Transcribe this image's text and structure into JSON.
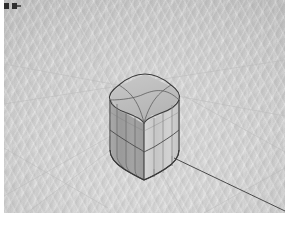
{
  "app": {
    "window_title": "3D Modeling Viewport",
    "background_color": "#cccccc"
  },
  "toolbar": {
    "marks": [
      {
        "name": "select-tool-marker",
        "label": ""
      },
      {
        "name": "pan-tool-marker",
        "label": ""
      }
    ]
  },
  "viewport": {
    "name": "3d-viewport",
    "ground_color": "#cfcfcf",
    "horizon_color": "#c4c4c4",
    "grid_line_color": "#bdbdbd",
    "width": 281,
    "height": 213
  },
  "model": {
    "name": "rounded-box",
    "description": "Rounded-corner box with subdivided faces",
    "edge_color": "#3a3a3a",
    "subdivision_color": "#6b6b6b",
    "top_face_color": "#c0c0c0",
    "left_face_color": "#9f9f9f",
    "right_face_color": "#cfcfcf",
    "top_face_divisions": 2,
    "body_horizontal_divisions": 2,
    "bounds": {
      "x": 104,
      "y": 74,
      "width": 78,
      "height": 100
    }
  },
  "guide_line": {
    "name": "inference-guide-line",
    "color": "#4a4a4a",
    "from": {
      "x": 172,
      "y": 160
    },
    "to": {
      "x": 283,
      "y": 212
    }
  },
  "ground_guides": [
    {
      "name": "ground-guide-1",
      "x1": 0,
      "y1": 196,
      "x2": 128,
      "y2": 124
    },
    {
      "name": "ground-guide-2",
      "x1": 0,
      "y1": 148,
      "x2": 104,
      "y2": 208
    },
    {
      "name": "ground-guide-3",
      "x1": 24,
      "y1": 212,
      "x2": 176,
      "y2": 98
    },
    {
      "name": "ground-guide-4",
      "x1": 180,
      "y1": 96,
      "x2": 281,
      "y2": 152
    },
    {
      "name": "ground-guide-5",
      "x1": 0,
      "y1": 104,
      "x2": 281,
      "y2": 60
    },
    {
      "name": "ground-guide-6",
      "x1": 200,
      "y1": 213,
      "x2": 281,
      "y2": 168
    }
  ]
}
